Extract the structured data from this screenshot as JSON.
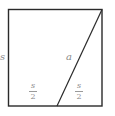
{
  "diagram": {
    "title": "",
    "shapes": {
      "square": {
        "x": 8,
        "y": 9,
        "width": 94,
        "height": 97,
        "stroke": "#2a2a2a"
      },
      "diagonal": {
        "x1": 102,
        "y1": 9,
        "x2": 57,
        "y2": 106,
        "stroke": "#2a2a2a"
      }
    },
    "labels": {
      "side": "s",
      "hypotenuse": "a",
      "left_half": {
        "numerator": "s",
        "denominator": "2"
      },
      "right_half": {
        "numerator": "s",
        "denominator": "2"
      }
    },
    "colors": {
      "line": "#2a2a2a",
      "label": "#8a8a8a",
      "background": "#ffffff"
    }
  }
}
